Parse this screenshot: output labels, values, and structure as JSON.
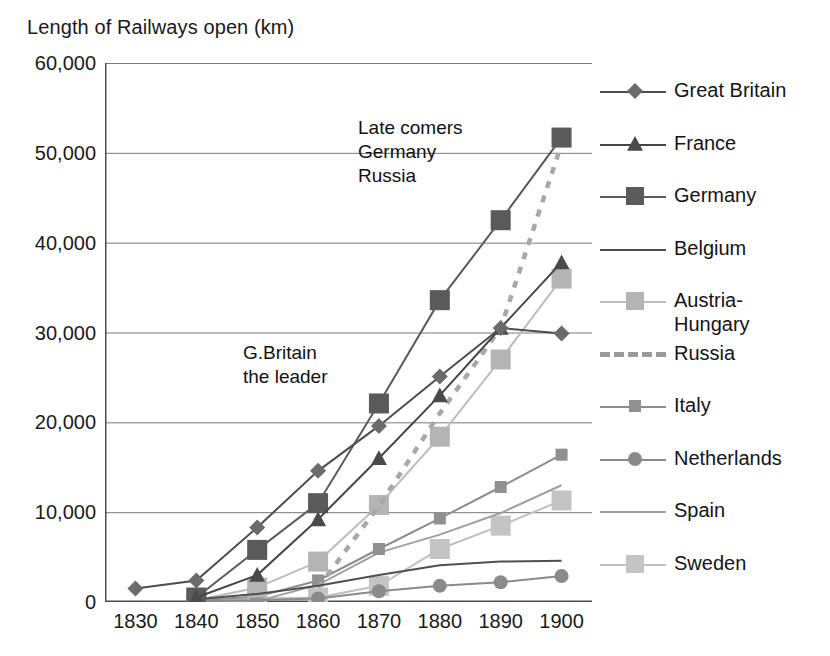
{
  "chart_data": {
    "type": "line",
    "title": "Length of Railways open (km)",
    "xlabel": "",
    "ylabel": "",
    "ylim": [
      0,
      60000
    ],
    "ytick_labels": [
      "60,000",
      "50,000",
      "40,000",
      "30,000",
      "20,000",
      "10,000",
      "0"
    ],
    "ytick_values": [
      60000,
      50000,
      40000,
      30000,
      20000,
      10000,
      0
    ],
    "grid": true,
    "legend_position": "right",
    "categories": [
      "1830",
      "1840",
      "1850",
      "1860",
      "1870",
      "1880",
      "1890",
      "1900"
    ],
    "x": [
      1830,
      1840,
      1850,
      1860,
      1870,
      1880,
      1890,
      1900
    ],
    "series": [
      {
        "name": "Great Britain",
        "marker": "diamond",
        "color": "#6b6b6b",
        "line_color": "#4d4d4d",
        "dashed": false,
        "values": [
          1500,
          2400,
          8300,
          14600,
          19600,
          25100,
          30500,
          29900
        ]
      },
      {
        "name": "France",
        "marker": "triangle",
        "color": "#4a4a4a",
        "line_color": "#454545",
        "dashed": false,
        "values": [
          null,
          500,
          3000,
          9200,
          16000,
          23000,
          30500,
          37800
        ]
      },
      {
        "name": "Germany",
        "marker": "square",
        "color": "#5a5a5a",
        "line_color": "#5a5a5a",
        "dashed": false,
        "values": [
          null,
          500,
          5800,
          11000,
          22100,
          33600,
          42500,
          51700
        ]
      },
      {
        "name": "Belgium",
        "marker": "none",
        "color": "#4f4f4f",
        "line_color": "#4f4f4f",
        "dashed": false,
        "values": [
          null,
          300,
          900,
          1800,
          3000,
          4100,
          4500,
          4600
        ]
      },
      {
        "name": "Austria-Hungary",
        "marker": "square",
        "color": "#b4b4b4",
        "line_color": "#bdbdbd",
        "dashed": false,
        "values": [
          null,
          200,
          1600,
          4500,
          10800,
          18400,
          27000,
          36000
        ]
      },
      {
        "name": "Russia",
        "marker": "none",
        "color": "#a8a8a8",
        "line_color": "#a8a8a8",
        "dashed": true,
        "values": [
          null,
          null,
          null,
          1600,
          10700,
          21000,
          30500,
          51000
        ]
      },
      {
        "name": "Italy",
        "marker": "square",
        "color": "#909090",
        "line_color": "#8c8c8c",
        "dashed": false,
        "values": [
          null,
          200,
          600,
          2400,
          5900,
          9300,
          12800,
          16400
        ]
      },
      {
        "name": "Netherlands",
        "marker": "circle",
        "color": "#8a8a8a",
        "line_color": "#8a8a8a",
        "dashed": false,
        "values": [
          null,
          100,
          200,
          400,
          1200,
          1800,
          2200,
          2900
        ]
      },
      {
        "name": "Spain",
        "marker": "none",
        "color": "#9f9f9f",
        "line_color": "#9f9f9f",
        "dashed": false,
        "values": [
          null,
          0,
          100,
          1900,
          5500,
          7500,
          9900,
          13000
        ]
      },
      {
        "name": "Sweden",
        "marker": "square",
        "color": "#c4c4c4",
        "line_color": "#c0c0c0",
        "dashed": false,
        "values": [
          null,
          0,
          400,
          500,
          1800,
          5900,
          8500,
          11300
        ]
      }
    ],
    "annotations": [
      {
        "id": "late-comers",
        "text": "Late comers\nGermany\nRussia"
      },
      {
        "id": "gbritain-leader",
        "text": "G.Britain\nthe leader"
      }
    ]
  },
  "axis": {
    "frame_color": "#4d4d4d",
    "grid_color": "#7a7a7a"
  }
}
